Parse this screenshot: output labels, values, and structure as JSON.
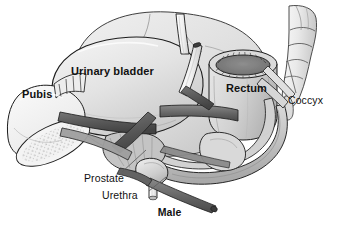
{
  "figure": {
    "kind": "anatomical-illustration",
    "view": "male pelvis, three-quarter cutaway",
    "caption": "Male",
    "background_color": "#ffffff",
    "ink_color": "#111111"
  },
  "labels": {
    "urinary_bladder": "Urinary bladder",
    "pubis": "Pubis",
    "rectum": "Rectum",
    "coccyx": "Coccyx",
    "prostate": "Prostate",
    "urethra": "Urethra",
    "caption": "Male"
  },
  "label_styles": {
    "urinary_bladder": "bold",
    "pubis": "bold",
    "rectum": "bold",
    "coccyx": "regular",
    "prostate": "regular",
    "urethra": "regular",
    "caption": "bold"
  },
  "leader_lines": {
    "coccyx": true,
    "prostate": true,
    "urethra": true,
    "urinary_bladder": false,
    "pubis": false,
    "rectum": false
  },
  "structures": [
    {
      "name": "urinary-bladder",
      "fill": "#e3e3e3",
      "stroke": "#1c1c1c",
      "note": "large dome-shaped organ, center-left"
    },
    {
      "name": "pubis-bone",
      "fill": "#f2f2f2",
      "stroke": "#1c1c1c",
      "note": "stippled bone, left, cut surface"
    },
    {
      "name": "rectum",
      "fill": "#d4d4d4",
      "stroke": "#1c1c1c",
      "note": "cylinder with crenulated lumen, right"
    },
    {
      "name": "rectum-lumen",
      "fill": "#7d7d7d",
      "stroke": "#1c1c1c",
      "note": "scalloped inner ring"
    },
    {
      "name": "sacrum-coccyx",
      "fill": "#e8e8e8",
      "stroke": "#3a3a3a",
      "note": "segmented vertical bone, far right"
    },
    {
      "name": "prostate",
      "fill": "#cfcfcf",
      "stroke": "#1c1c1c",
      "note": "small gland below bladder"
    },
    {
      "name": "urethra-tube",
      "fill": "#dcdcdc",
      "stroke": "#1c1c1c",
      "note": "narrow tube descending from prostate"
    },
    {
      "name": "ureter-left",
      "fill": "#f4f4f4",
      "stroke": "#1c1c1c",
      "note": "white tube at top"
    },
    {
      "name": "ureter-right",
      "fill": "#f4f4f4",
      "stroke": "#1c1c1c",
      "note": "white tube at top"
    },
    {
      "name": "pelvic-floor-muscle-band",
      "fill": "#5e5e5e",
      "stroke": "#222222",
      "note": "dark crossing bands"
    },
    {
      "name": "levator-sheet",
      "fill": "#b6b6b6",
      "stroke": "#1c1c1c",
      "note": "pale sheet of pelvic floor"
    },
    {
      "name": "pelvic-rim",
      "fill": "#c9c9c9",
      "stroke": "#1c1c1c",
      "note": "curved bony rim sweeping right"
    },
    {
      "name": "ischium-mass",
      "fill": "#d9d9d9",
      "stroke": "#1c1c1c",
      "note": "rounded mass lower right"
    }
  ],
  "colors": {
    "background": "#ffffff",
    "outline": "#1c1c1c",
    "organ_light": "#e3e3e3",
    "organ_mid": "#cfcfcf",
    "organ_dark": "#8f8f8f",
    "muscle_dark": "#5e5e5e",
    "bone_pale": "#f2f2f2",
    "lumen": "#7d7d7d",
    "leader_line": "#6b6b6b",
    "text": "#111111"
  }
}
